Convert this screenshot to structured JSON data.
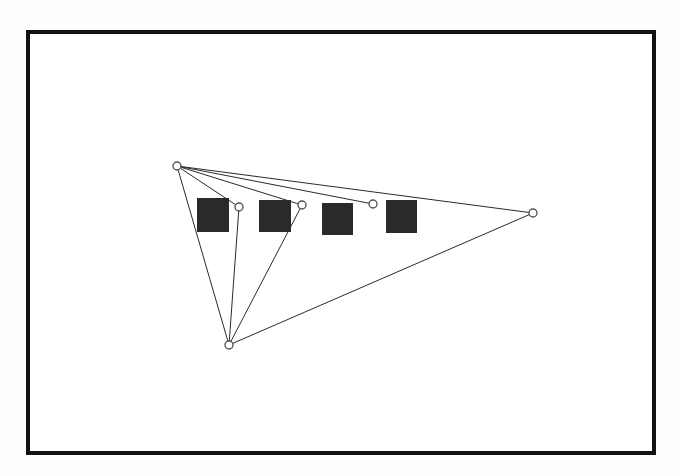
{
  "page": {
    "width": 679,
    "height": 476,
    "background_color": "#fefefe"
  },
  "frame": {
    "name": "figure-border",
    "x": 26,
    "y": 30,
    "width": 630,
    "height": 425,
    "border_width": 4,
    "border_color": "#121212",
    "fill_color": "#ffffff"
  },
  "figure": {
    "line_color": "#2b2b2b",
    "line_width": 1,
    "node_stroke_color": "#555555",
    "node_fill_color": "#ffffff",
    "node_radius": 4,
    "square_color": "#2a2a2a",
    "vertices": [
      {
        "id": "apex",
        "label": "top-left apex",
        "x": 177,
        "y": 166
      },
      {
        "id": "node-a",
        "label": "node A",
        "x": 239,
        "y": 207
      },
      {
        "id": "node-b",
        "label": "node B",
        "x": 302,
        "y": 205
      },
      {
        "id": "node-c",
        "label": "node C",
        "x": 373,
        "y": 204
      },
      {
        "id": "right-tip",
        "label": "right tip",
        "x": 533,
        "y": 213
      },
      {
        "id": "bottom",
        "label": "bottom vertex",
        "x": 229,
        "y": 345
      }
    ],
    "edges": [
      {
        "from": "apex",
        "to": "node-a"
      },
      {
        "from": "apex",
        "to": "node-b"
      },
      {
        "from": "apex",
        "to": "node-c"
      },
      {
        "from": "apex",
        "to": "right-tip"
      },
      {
        "from": "apex",
        "to": "bottom"
      },
      {
        "from": "bottom",
        "to": "node-a"
      },
      {
        "from": "bottom",
        "to": "node-b"
      },
      {
        "from": "bottom",
        "to": "right-tip"
      }
    ],
    "squares": [
      {
        "id": "square-1",
        "x": 197,
        "y": 198,
        "width": 32,
        "height": 34
      },
      {
        "id": "square-2",
        "x": 259,
        "y": 200,
        "width": 32,
        "height": 32
      },
      {
        "id": "square-3",
        "x": 322,
        "y": 203,
        "width": 31,
        "height": 32
      },
      {
        "id": "square-4",
        "x": 386,
        "y": 200,
        "width": 31,
        "height": 33
      }
    ]
  }
}
